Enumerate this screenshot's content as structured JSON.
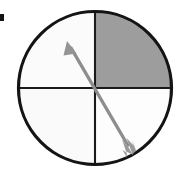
{
  "figure": {
    "description": "A black-outlined circle divided into four quadrants by a vertical and a horizontal line. The upper-right quadrant is filled medium gray; the other three quadrants are white. A gray double-headed arrow runs diagonally through the center from lower right to upper left.",
    "background_color": "#ffffff"
  },
  "circle": {
    "name": "circle-outline",
    "center_x": 95,
    "center_y": 88,
    "radius": 77,
    "stroke_color": "#141414",
    "stroke_width": 3.2,
    "fill_color": "#ffffff"
  },
  "axes": {
    "vertical": {
      "name": "vertical-divider",
      "x": 95,
      "y_top": 11,
      "y_bottom": 165,
      "stroke_color": "#1a1a1a",
      "stroke_width": 2.1
    },
    "horizontal": {
      "name": "horizontal-divider",
      "y": 88,
      "x_left": 18,
      "x_right": 172,
      "stroke_color": "#1a1a1a",
      "stroke_width": 2.1
    }
  },
  "quadrants": [
    {
      "name": "quadrant-upper-left",
      "position": "upper-left",
      "fill_color": "#fbfbfb",
      "shaded": false
    },
    {
      "name": "quadrant-upper-right",
      "position": "upper-right",
      "fill_color": "#9d9d9d",
      "shaded": true
    },
    {
      "name": "quadrant-lower-left",
      "position": "lower-left",
      "fill_color": "#fafafa",
      "shaded": false
    },
    {
      "name": "quadrant-lower-right",
      "position": "lower-right",
      "fill_color": "#fdfdfd",
      "shaded": false
    }
  ],
  "arrow": {
    "name": "diagonal-double-arrow",
    "stroke_color": "#8d8d8d",
    "stroke_width": 3.4,
    "head_fill": "#949494",
    "tail_fill": "#9a9a9a",
    "start_x": 132,
    "start_y": 153,
    "end_x": 67,
    "end_y": 41,
    "direction": "lower-right to upper-left"
  },
  "marker": {
    "name": "left-margin-tick",
    "x": 0,
    "y": 14,
    "width": 4,
    "height": 7,
    "color": "#141414"
  }
}
